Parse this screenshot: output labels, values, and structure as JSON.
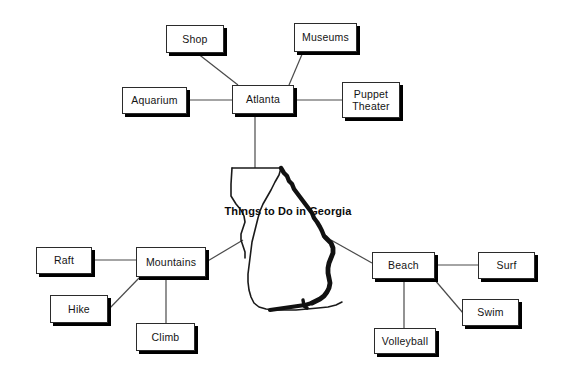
{
  "diagram": {
    "type": "concept-map",
    "center_label": "Things to Do in Georgia",
    "center_shape": "georgia-state-outline",
    "background_color": "#ffffff",
    "line_color": "#4a4a4a",
    "box_border_color": "#2b2b2b",
    "box_shadow_color": "#000000",
    "text_color": "#141414"
  },
  "branches": [
    {
      "hub": "Atlanta",
      "children": [
        "Shop",
        "Museums",
        "Aquarium",
        "Puppet Theater"
      ]
    },
    {
      "hub": "Mountains",
      "children": [
        "Raft",
        "Hike",
        "Climb"
      ]
    },
    {
      "hub": "Beach",
      "children": [
        "Surf",
        "Swim",
        "Volleyball"
      ]
    }
  ],
  "nodes": {
    "shop": "Shop",
    "museums": "Museums",
    "aquarium": "Aquarium",
    "atlanta": "Atlanta",
    "puppet_theater_line1": "Puppet",
    "puppet_theater_line2": "Theater",
    "raft": "Raft",
    "mountains": "Mountains",
    "hike": "Hike",
    "climb": "Climb",
    "beach": "Beach",
    "surf": "Surf",
    "swim": "Swim",
    "volleyball": "Volleyball"
  }
}
